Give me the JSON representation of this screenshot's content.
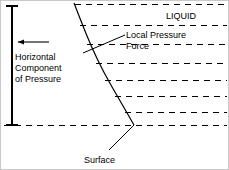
{
  "figure": {
    "background_color": "#ffffff",
    "line_color": "#000000",
    "border_color": "#c8c8c8",
    "width": 229,
    "height": 170
  },
  "labels": {
    "liquid": "LIQUID",
    "local_pressure_force": "Local Pressure\nForce",
    "horizontal_component": "Horizontal\nComponent\nof Pressure",
    "surface": "Surface"
  },
  "annotations": {
    "arrow_direction": "left",
    "bracket_orientation": "vertical",
    "leader_local_pressure_force": "diagonal-line",
    "leader_surface": "diagonal-line"
  },
  "chart_data": {
    "type": "line",
    "title": "Horizontal Component of Pressure",
    "xlabel": "",
    "ylabel": "",
    "grid": true,
    "legend_position": "none",
    "xlim": [
      0,
      229
    ],
    "ylim": [
      0,
      170
    ],
    "series": [
      {
        "name": "Surface profile curve",
        "kind": "curve",
        "points": [
          [
            73,
            2
          ],
          [
            80,
            20
          ],
          [
            90,
            45
          ],
          [
            103,
            72
          ],
          [
            118,
            98
          ],
          [
            133,
            124
          ]
        ]
      },
      {
        "name": "Horizontal pressure arrow",
        "kind": "arrow",
        "points": [
          [
            17,
            41
          ],
          [
            48,
            41
          ]
        ],
        "direction": "left"
      },
      {
        "name": "Pressure bracket axis",
        "kind": "bracket",
        "points": [
          [
            11,
            5
          ],
          [
            11,
            124
          ]
        ],
        "cap_half_width": 6
      },
      {
        "name": "Leader to local pressure force",
        "kind": "leader",
        "points": [
          [
            82,
            52
          ],
          [
            124,
            34
          ]
        ]
      },
      {
        "name": "Leader to surface",
        "kind": "leader",
        "points": [
          [
            108,
            149
          ],
          [
            133,
            124
          ]
        ]
      }
    ],
    "dashed_gridlines": [
      {
        "y": 3,
        "x_start": 74,
        "x_end": 226
      },
      {
        "y": 24,
        "x_start": 79,
        "x_end": 226
      },
      {
        "y": 43,
        "x_start": 86,
        "x_end": 226
      },
      {
        "y": 62,
        "x_start": 95,
        "x_end": 226
      },
      {
        "y": 79,
        "x_start": 104,
        "x_end": 226
      },
      {
        "y": 95,
        "x_start": 114,
        "x_end": 226
      },
      {
        "y": 111,
        "x_start": 124,
        "x_end": 226
      },
      {
        "y": 124,
        "x_start": 3,
        "x_end": 226
      }
    ]
  }
}
